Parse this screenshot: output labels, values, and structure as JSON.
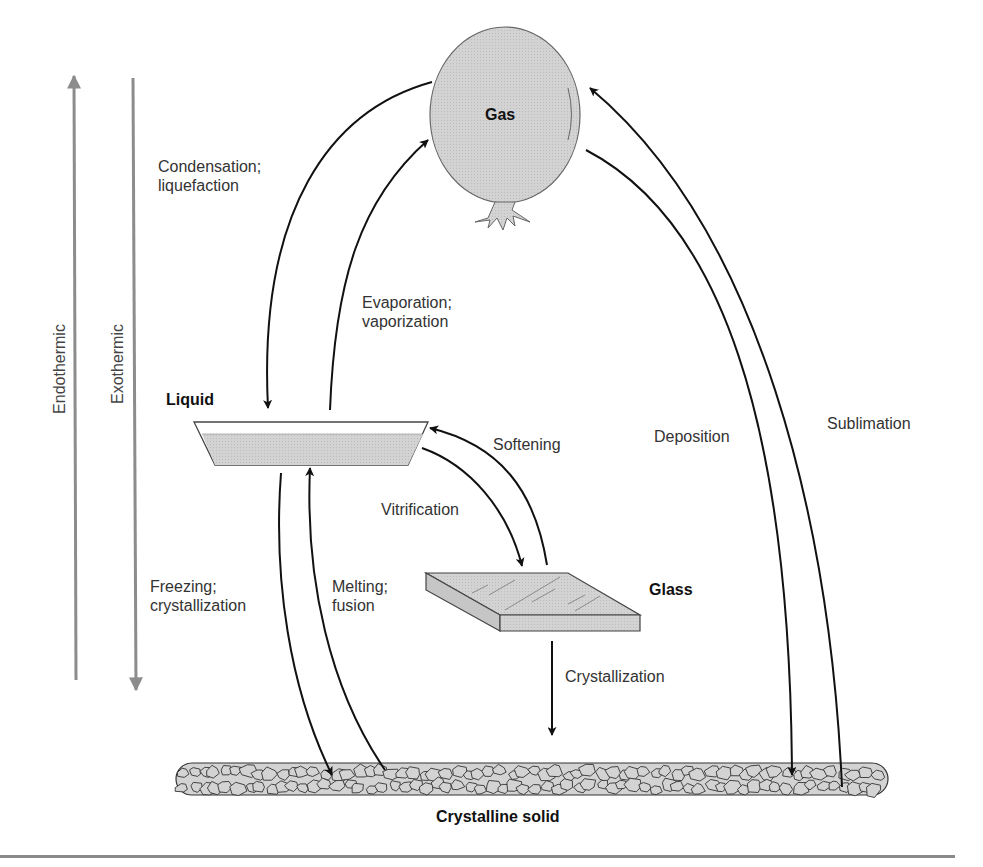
{
  "diagram": {
    "states": {
      "gas": "Gas",
      "liquid": "Liquid",
      "glass": "Glass",
      "crystalline_solid": "Crystalline solid"
    },
    "energy_axis": {
      "endothermic": "Endothermic",
      "exothermic": "Exothermic",
      "endothermic_direction": "up",
      "exothermic_direction": "down"
    },
    "transitions": [
      {
        "id": "condensation",
        "label": "Condensation;\nliquefaction",
        "from": "Gas",
        "to": "Liquid"
      },
      {
        "id": "evaporation",
        "label": "Evaporation;\nvaporization",
        "from": "Liquid",
        "to": "Gas"
      },
      {
        "id": "softening",
        "label": "Softening",
        "from": "Glass",
        "to": "Liquid"
      },
      {
        "id": "vitrification",
        "label": "Vitrification",
        "from": "Liquid",
        "to": "Glass"
      },
      {
        "id": "freezing",
        "label": "Freezing;\ncrystallization",
        "from": "Liquid",
        "to": "Crystalline solid"
      },
      {
        "id": "melting",
        "label": "Melting;\nfusion",
        "from": "Crystalline solid",
        "to": "Liquid"
      },
      {
        "id": "crystallization",
        "label": "Crystallization",
        "from": "Glass",
        "to": "Crystalline solid"
      },
      {
        "id": "deposition",
        "label": "Deposition",
        "from": "Gas",
        "to": "Crystalline solid"
      },
      {
        "id": "sublimation",
        "label": "Sublimation",
        "from": "Crystalline solid",
        "to": "Gas"
      }
    ],
    "colors": {
      "arrow": "#111111",
      "energy_arrow": "#8c8c8c",
      "fill": "#d0d0d0",
      "outline": "#555555"
    }
  }
}
